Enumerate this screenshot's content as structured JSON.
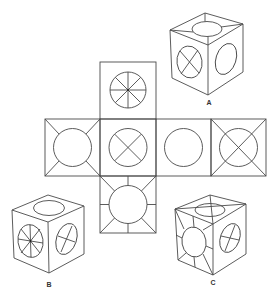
{
  "diagram": {
    "type": "cube-net-puzzle",
    "stroke_color": "#4a4a4a",
    "background": "#ffffff",
    "net": {
      "square_size": 55,
      "faces": [
        {
          "id": "top",
          "position": "above-col2",
          "pattern": "circle-with-8-spokes"
        },
        {
          "id": "left",
          "position": "row-col1",
          "pattern": "circle-with-corner-ticks"
        },
        {
          "id": "center",
          "position": "row-col2",
          "pattern": "circle-with-x"
        },
        {
          "id": "right",
          "position": "row-col3",
          "pattern": "plain-circle"
        },
        {
          "id": "far-right",
          "position": "row-col4",
          "pattern": "circle-with-full-diagonals"
        },
        {
          "id": "bottom",
          "position": "below-col2",
          "pattern": "circle-with-8-radial-ticks"
        }
      ]
    },
    "options": [
      {
        "label": "A",
        "top": "circle-with-corner-ticks",
        "left": "circle-with-x",
        "right": "plain-circle"
      },
      {
        "label": "B",
        "top": "plain-circle",
        "left": "circle-with-8-spokes",
        "right": "circle-with-x"
      },
      {
        "label": "C",
        "top": "circle-with-full-diagonals",
        "left": "circle-with-8-radial-ticks",
        "right": "circle-with-x"
      }
    ]
  }
}
